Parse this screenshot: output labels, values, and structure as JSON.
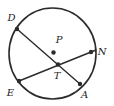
{
  "figure": {
    "background": "#ffffff",
    "stroke_color": "#2b2b2b",
    "label_color": "#1c1c1c",
    "stroke_width_circle": 1.6,
    "stroke_width_chord": 1.4,
    "dot_radius": 2.2,
    "circle": {
      "cx": 52.5,
      "cy": 53.5,
      "rx": 43.5,
      "ry": 45.5
    },
    "chords": [
      {
        "name": "chord-D-A",
        "x1": 17,
        "y1": 29,
        "x2": 80,
        "y2": 84
      },
      {
        "name": "chord-E-N",
        "x1": 19,
        "y1": 81,
        "x2": 96,
        "y2": 50
      }
    ],
    "points": [
      {
        "name": "D",
        "x": 17,
        "y": 29,
        "label": {
          "text": "D",
          "x": 11.5,
          "y": 21
        }
      },
      {
        "name": "P",
        "x": 53.5,
        "y": 52.5,
        "label": {
          "text": "P",
          "x": 59,
          "y": 43
        }
      },
      {
        "name": "N",
        "x": 91,
        "y": 52,
        "label": {
          "text": "N",
          "x": 102,
          "y": 55
        }
      },
      {
        "name": "T",
        "x": 58,
        "y": 64.5,
        "label": {
          "text": "T",
          "x": 57,
          "y": 78.5
        }
      },
      {
        "name": "E",
        "x": 19,
        "y": 81,
        "label": {
          "text": "E",
          "x": 10.5,
          "y": 95.5
        }
      },
      {
        "name": "A",
        "x": 80,
        "y": 84,
        "label": {
          "text": "A",
          "x": 84.5,
          "y": 97.5
        }
      }
    ]
  }
}
